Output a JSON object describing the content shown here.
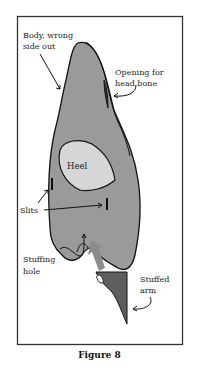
{
  "figure": {
    "caption": "Figure 8",
    "labels": {
      "body": [
        "Body, wrong",
        "side out"
      ],
      "opening": [
        "Opening for",
        "head bone"
      ],
      "heel": "Heel",
      "slits": "Slits",
      "stuffing_hole": [
        "Stuffing",
        "hole"
      ],
      "stuffed_arm": [
        "Stuffed",
        "arm"
      ]
    },
    "colors": {
      "body_fill": "#9a9a9a",
      "heel_fill": "#d6d6d6",
      "arm_fill": "#5e5e5e",
      "arrow_fill": "#8c8c8c",
      "outline": "#111111",
      "frame": "#333333"
    }
  }
}
